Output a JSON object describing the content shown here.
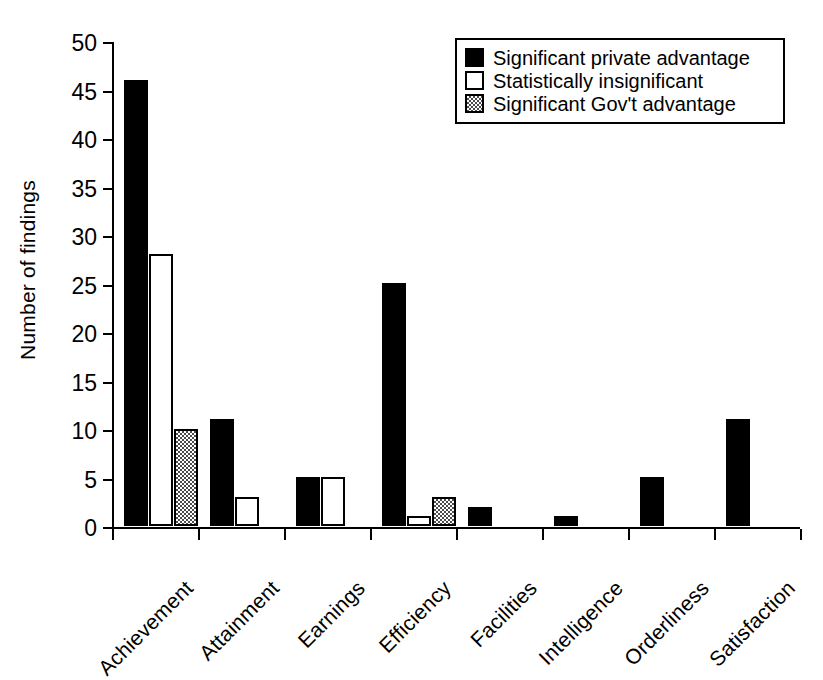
{
  "chart_data": {
    "type": "bar",
    "title": "",
    "xlabel": "",
    "ylabel": "Number of findings",
    "ylim": [
      0,
      50
    ],
    "yticks": [
      0,
      5,
      10,
      15,
      20,
      25,
      30,
      35,
      40,
      45,
      50
    ],
    "grid": false,
    "legend_position": "top-right",
    "categories": [
      "Achievement",
      "Attainment",
      "Earnings",
      "Efficiency",
      "Facilities",
      "Intelligence",
      "Orderliness",
      "Satisfaction"
    ],
    "series": [
      {
        "name": "Significant private advantage",
        "style": "black",
        "color": "#000000",
        "values": [
          46,
          11,
          5,
          25,
          2,
          1,
          5,
          11
        ]
      },
      {
        "name": "Statistically insignificant",
        "style": "white",
        "color": "#ffffff",
        "values": [
          28,
          3,
          5,
          1,
          0,
          0,
          0,
          0
        ]
      },
      {
        "name": "Significant Gov't advantage",
        "style": "gray-hatched",
        "color": "#808080",
        "values": [
          10,
          0,
          0,
          3,
          0,
          0,
          0,
          0
        ]
      }
    ]
  },
  "legend": {
    "entries": [
      {
        "label": "Significant private advantage",
        "swatch": "black"
      },
      {
        "label": "Statistically insignificant",
        "swatch": "white"
      },
      {
        "label": "Significant Gov't advantage",
        "swatch": "gray"
      }
    ]
  }
}
